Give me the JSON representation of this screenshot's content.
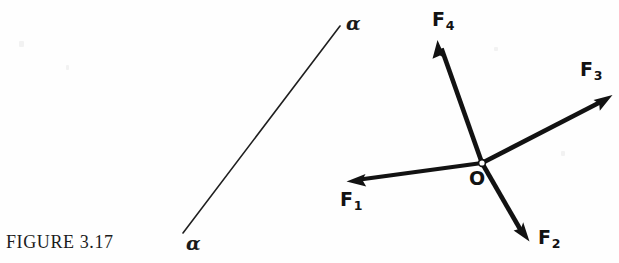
{
  "figure": {
    "caption": "FIGURE 3.17",
    "background_color": "#fefefe",
    "ink_color": "#121212"
  },
  "angle_line": {
    "label_top": "α",
    "label_bottom": "α",
    "x1": 340,
    "y1": 26,
    "x2": 183,
    "y2": 233
  },
  "force_diagram": {
    "origin": {
      "label": "O",
      "x": 482,
      "y": 163
    },
    "vectors": [
      {
        "name": "F1",
        "label": "F",
        "subscript": "1",
        "tip_x": 348,
        "tip_y": 181
      },
      {
        "name": "F2",
        "label": "F",
        "subscript": "2",
        "tip_x": 528,
        "tip_y": 240
      },
      {
        "name": "F3",
        "label": "F",
        "subscript": "3",
        "tip_x": 611,
        "tip_y": 95
      },
      {
        "name": "F4",
        "label": "F",
        "subscript": "4",
        "tip_x": 438,
        "tip_y": 42
      }
    ]
  }
}
